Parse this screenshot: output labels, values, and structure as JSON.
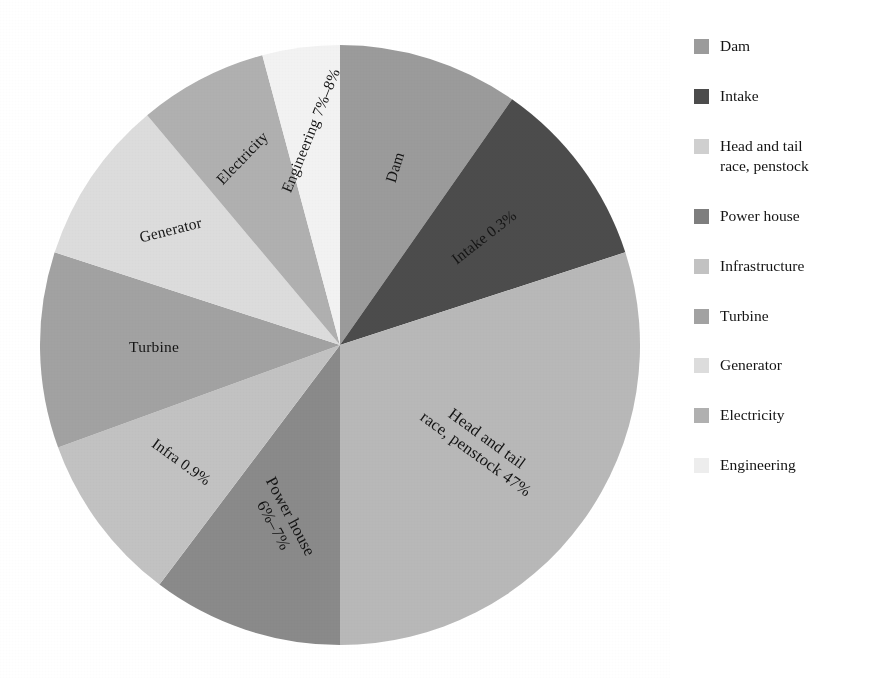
{
  "chart_data": {
    "type": "pie",
    "title": "",
    "subtitle": "",
    "xlabel": "",
    "ylabel": "",
    "legend_position": "right",
    "grid": false,
    "categories": [
      "Dam",
      "Intake",
      "Head and tail race, penstock",
      "Power house",
      "Infrastructure",
      "Turbine",
      "Generator",
      "Electricity",
      "Engineering"
    ],
    "values": [
      9.7,
      10.3,
      30.0,
      10.3,
      9.2,
      10.6,
      8.9,
      6.9,
      4.1
    ],
    "slices": [
      {
        "name": "Dam",
        "label": "Dam",
        "percent_text": "",
        "start_angle": 0,
        "end_angle": 35,
        "color": "#9b9b9b",
        "label_lines": [
          "Dam"
        ],
        "label_radius": 0.62,
        "label_rotation": -73
      },
      {
        "name": "Intake",
        "label": "Intake 0.3%",
        "percent_text": "0.3%",
        "start_angle": 35,
        "end_angle": 72,
        "color": "#4c4c4c",
        "label_lines": [
          "Intake 0.3%"
        ],
        "label_radius": 0.6,
        "label_rotation": -38
      },
      {
        "name": "Head and tail race, penstock",
        "label": "Head and tail race, penstock 47%",
        "percent_text": "47%",
        "start_angle": 72,
        "end_angle": 180,
        "color": "#b8b8b8",
        "label_lines": [
          "Head and tail",
          "race, penstock 47%"
        ],
        "label_radius": 0.58,
        "label_rotation": 36
      },
      {
        "name": "Power house",
        "label": "Power house 6%–7%",
        "percent_text": "6%–7%",
        "start_angle": 180,
        "end_angle": 217,
        "color": "#8a8a8a",
        "label_lines": [
          "Power house",
          "6%–7%"
        ],
        "label_radius": 0.62,
        "label_rotation": 62
      },
      {
        "name": "Infrastructure",
        "label": "Infra 0.9%",
        "percent_text": "0.9%",
        "start_angle": 217,
        "end_angle": 250,
        "color": "#c2c2c2",
        "label_lines": [
          "Infra 0.9%"
        ],
        "label_radius": 0.66,
        "label_rotation": 36
      },
      {
        "name": "Turbine",
        "label": "Turbine",
        "percent_text": "",
        "start_angle": 250,
        "end_angle": 288,
        "color": "#a2a2a2",
        "label_lines": [
          "Turbine"
        ],
        "label_radius": 0.62,
        "label_rotation": 0
      },
      {
        "name": "Generator",
        "label": "Generator",
        "percent_text": "",
        "start_angle": 288,
        "end_angle": 320,
        "color": "#dcdcdc",
        "label_lines": [
          "Generator"
        ],
        "label_radius": 0.68,
        "label_rotation": -14
      },
      {
        "name": "Electricity",
        "label": "Electricity",
        "percent_text": "",
        "start_angle": 320,
        "end_angle": 345,
        "color": "#b0b0b0",
        "label_lines": [
          "Electricity"
        ],
        "label_radius": 0.7,
        "label_rotation": -46
      },
      {
        "name": "Engineering",
        "label": "Engineering 7%–8%",
        "percent_text": "7%–8%",
        "start_angle": 345,
        "end_angle": 360,
        "color": "#f2f2f2",
        "label_lines": [
          "Engineering 7%–8%"
        ],
        "label_radius": 0.72,
        "label_rotation": -68
      }
    ]
  },
  "pie": {
    "center_x": 340,
    "center_y": 345,
    "radius": 300
  },
  "legend": {
    "items": [
      {
        "label": "Dam",
        "color": "#9b9b9b"
      },
      {
        "label": "Intake",
        "color": "#4c4c4c"
      },
      {
        "label": "Head and tail\nrace, penstock",
        "color": "#cfcfcf"
      },
      {
        "label": "Power house",
        "color": "#7e7e7e"
      },
      {
        "label": "Infrastructure",
        "color": "#c2c2c2"
      },
      {
        "label": "Turbine",
        "color": "#a2a2a2"
      },
      {
        "label": "Generator",
        "color": "#dcdcdc"
      },
      {
        "label": "Electricity",
        "color": "#b0b0b0"
      },
      {
        "label": "Engineering",
        "color": "#ededed"
      }
    ]
  },
  "colors": {
    "background": "#ffffff",
    "text": "#141414"
  }
}
